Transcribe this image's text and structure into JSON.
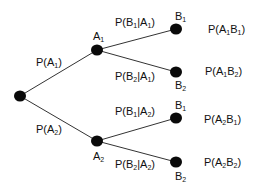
{
  "diagram": {
    "type": "probability-tree",
    "colors": {
      "node": "#0a0a0a",
      "edge": "#333333",
      "text": "#111111"
    },
    "nodes": {
      "root": {
        "x": 20,
        "y": 96
      },
      "A1": {
        "x": 97,
        "y": 50,
        "label": "A",
        "sub": "1"
      },
      "A2": {
        "x": 97,
        "y": 141,
        "label": "A",
        "sub": "2"
      },
      "A1B1": {
        "x": 176,
        "y": 29,
        "label": "B",
        "sub": "1"
      },
      "A1B2": {
        "x": 176,
        "y": 72,
        "label": "B",
        "sub": "2"
      },
      "A2B1": {
        "x": 176,
        "y": 118,
        "label": "B",
        "sub": "1"
      },
      "A2B2": {
        "x": 176,
        "y": 162,
        "label": "B",
        "sub": "2"
      }
    },
    "edge_labels": {
      "pA1": {
        "pre": "P(A",
        "sub": "1",
        "post": ")"
      },
      "pA2": {
        "pre": "P(A",
        "sub": "2",
        "post": ")"
      },
      "pB1A1": {
        "pre": "P(B",
        "sub": "1",
        "mid": "|A",
        "sub2": "1",
        "post": ")"
      },
      "pB2A1": {
        "pre": "P(B",
        "sub": "2",
        "mid": "|A",
        "sub2": "1",
        "post": ")"
      },
      "pB1A2": {
        "pre": "P(B",
        "sub": "1",
        "mid": "|A",
        "sub2": "2",
        "post": ")"
      },
      "pB2A2": {
        "pre": "P(B",
        "sub": "2",
        "mid": "|A",
        "sub2": "2",
        "post": ")"
      }
    },
    "outcomes": {
      "o1": {
        "pre": "P(A",
        "sub": "1",
        "mid": "B",
        "sub2": "1",
        "post": ")"
      },
      "o2": {
        "pre": "P(A",
        "sub": "1",
        "mid": "B",
        "sub2": "2",
        "post": ")"
      },
      "o3": {
        "pre": "P(A",
        "sub": "2",
        "mid": "B",
        "sub2": "1",
        "post": ")"
      },
      "o4": {
        "pre": "P(A",
        "sub": "2",
        "mid": "B",
        "sub2": "2",
        "post": ")"
      }
    }
  }
}
